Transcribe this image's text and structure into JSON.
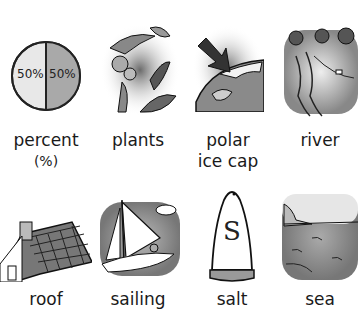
{
  "cards": [
    {
      "label": "percent",
      "sub": "(%)",
      "icon": "pie-chart-icon",
      "pie_left": "50%",
      "pie_right": "50%"
    },
    {
      "label": "plants",
      "icon": "plants-icon"
    },
    {
      "label": "polar",
      "label2": "ice cap",
      "icon": "polar-ice-cap-icon"
    },
    {
      "label": "river",
      "icon": "river-icon"
    },
    {
      "label": "roof",
      "icon": "roof-icon"
    },
    {
      "label": "sailing",
      "icon": "sailboat-icon"
    },
    {
      "label": "salt",
      "icon": "salt-shaker-icon",
      "symbol": "S"
    },
    {
      "label": "sea",
      "icon": "sea-icon"
    }
  ],
  "colors": {
    "shade": "#9a9a9a",
    "light": "#e6e6e6",
    "ink": "#1a1a1a"
  }
}
